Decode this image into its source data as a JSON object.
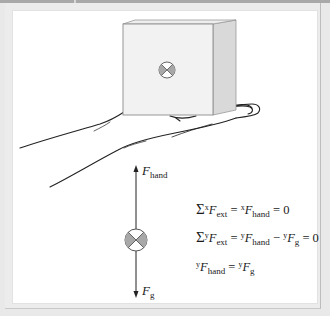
{
  "figure": {
    "type": "free-body diagram",
    "colors": {
      "background": "#e9e9e9",
      "panel": "#ffffff",
      "top_strip": "#a9a9a9",
      "cube_front": "#f2f2f2",
      "cube_side": "#d9d9d9",
      "symbol_fill": "#a8a8a8",
      "line": "#222222"
    },
    "object_symbol": "circle-with-x (center of mass, into page)",
    "force_labels": {
      "hand": {
        "base": "F",
        "sub": "hand"
      },
      "gravity": {
        "base": "F",
        "sub": "g"
      }
    },
    "equations": [
      {
        "sigma": "Σ",
        "sup1": "x",
        "lhs_var": "F",
        "lhs_sub": "ext",
        "eq1": " = ",
        "sup2": "x",
        "rhs_var": "F",
        "rhs_sub": "hand",
        "tail": " = 0"
      },
      {
        "sigma": "Σ",
        "sup1": "y",
        "lhs_var": "F",
        "lhs_sub": "ext",
        "eq1": " = ",
        "sup2": "y",
        "rhs_var": "F",
        "rhs_sub": "hand",
        "minus": " − ",
        "sup3": "y",
        "rhs2_var": "F",
        "rhs2_sub": "g",
        "tail": " = 0"
      },
      {
        "sup1": "y",
        "lhs_var": "F",
        "lhs_sub": "hand",
        "eq1": " = ",
        "sup2": "y",
        "rhs_var": "F",
        "rhs_sub": "g"
      }
    ]
  }
}
